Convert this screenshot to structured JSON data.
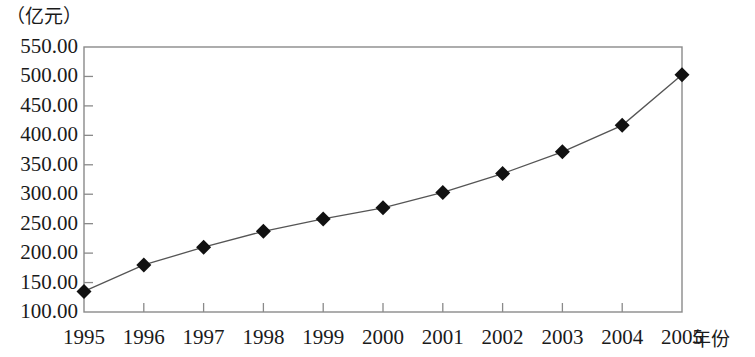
{
  "chart_data": {
    "type": "line",
    "title": "",
    "subtitle": "",
    "xlabel": "年份",
    "ylabel": "（亿元）",
    "ylabel_position": "top-left",
    "categories": [
      "1995",
      "1996",
      "1997",
      "1998",
      "1999",
      "2000",
      "2001",
      "2002",
      "2003",
      "2004",
      "2005"
    ],
    "x": [
      1995,
      1996,
      1997,
      1998,
      1999,
      2000,
      2001,
      2002,
      2003,
      2004,
      2005
    ],
    "values": [
      135.0,
      180.0,
      210.0,
      237.0,
      258.0,
      277.0,
      303.0,
      335.0,
      372.0,
      417.0,
      503.0
    ],
    "series": [
      {
        "name": "",
        "values": [
          135.0,
          180.0,
          210.0,
          237.0,
          258.0,
          277.0,
          303.0,
          335.0,
          372.0,
          417.0,
          503.0
        ]
      }
    ],
    "ylim": [
      100,
      550
    ],
    "xlim": [
      1995,
      2005
    ],
    "y_ticks": [
      550.0,
      500.0,
      450.0,
      400.0,
      350.0,
      300.0,
      250.0,
      200.0,
      150.0,
      100.0
    ],
    "y_tick_labels": [
      "550.00",
      "500.00",
      "450.00",
      "400.00",
      "350.00",
      "300.00",
      "250.00",
      "200.00",
      "150.00",
      "100.00"
    ],
    "x_ticks": [
      1995,
      1996,
      1997,
      1998,
      1999,
      2000,
      2001,
      2002,
      2003,
      2004,
      2005
    ],
    "grid": false,
    "legend": false,
    "legend_position": "none",
    "marker": "diamond",
    "marker_color": "#111111",
    "line_color": "#555555",
    "plot_border_color": "#8a8a8a",
    "background_color": "#ffffff",
    "annotations": []
  }
}
